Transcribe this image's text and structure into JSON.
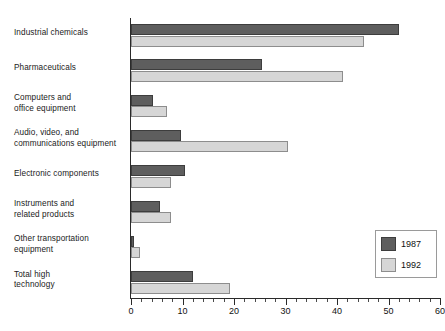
{
  "chart_data": {
    "type": "bar",
    "orientation": "horizontal",
    "title": "",
    "xlabel": "",
    "ylabel": "",
    "xlim": [
      0,
      60
    ],
    "grid": false,
    "legend_position": "bottom-right",
    "x_major_ticks": [
      0,
      10,
      20,
      30,
      40,
      50,
      60
    ],
    "x_tick_labels": [
      "0",
      "10",
      "20",
      "30",
      "40",
      "50",
      "60"
    ],
    "x_minor_tick_step": 2,
    "categories": [
      "Industrial chemicals",
      "Pharmaceuticals",
      "Computers and office equipment",
      "Audio, video, and communications equipment",
      "Electronic components",
      "Instruments and related products",
      "Other transportation equipment",
      "Total high technology"
    ],
    "category_lines": [
      [
        "Industrial chemicals"
      ],
      [
        "Pharmaceuticals"
      ],
      [
        "Computers and",
        "office equipment"
      ],
      [
        "Audio, video, and",
        "communications equipment"
      ],
      [
        "Electronic components"
      ],
      [
        "Instruments and",
        "related products"
      ],
      [
        "Other transportation",
        "equipment"
      ],
      [
        "Total high",
        "technology"
      ]
    ],
    "series": [
      {
        "name": "1987",
        "color": "#5e5e5e",
        "values": [
          52,
          25.5,
          4.3,
          9.7,
          10.5,
          5.6,
          0.6,
          12
        ]
      },
      {
        "name": "1992",
        "color": "#d6d6d6",
        "values": [
          45.2,
          41.2,
          7,
          30.5,
          7.8,
          7.8,
          1.8,
          19.2
        ]
      }
    ]
  },
  "legend": {
    "entries": [
      {
        "label": "1987",
        "swatch": "dark-swatch"
      },
      {
        "label": "1992",
        "swatch": "light-swatch"
      }
    ]
  }
}
